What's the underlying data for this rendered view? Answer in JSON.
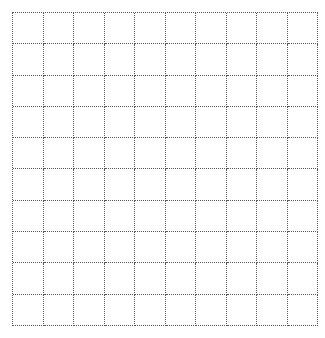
{
  "grid": {
    "rows": 10,
    "columns": 10,
    "line_color": "#5a5a5a",
    "line_style": "dotted",
    "background": "#ffffff"
  }
}
